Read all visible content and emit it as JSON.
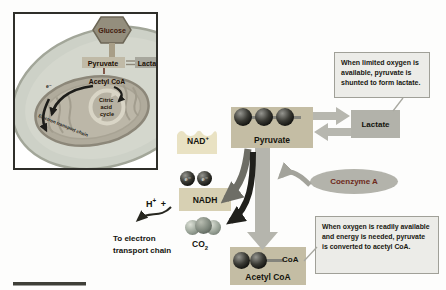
{
  "inset": {
    "glucose": "Glucose",
    "pyruvate": "Pyruvate",
    "lactate": "Lactate",
    "acetyl": "Acetyl CoA",
    "citric": [
      "Citric",
      "acid",
      "cycle"
    ],
    "electron": "e⁻",
    "etc": "Electron transport chain"
  },
  "main": {
    "pyruvate": "Pyruvate",
    "lactate": "Lactate",
    "nad": {
      "base": "NAD",
      "sup": "+"
    },
    "nadh": "NADH",
    "h": {
      "base": "H",
      "sup": "+",
      "tail": "+"
    },
    "to_etc": [
      "To electron",
      "transport chain"
    ],
    "co2": {
      "base": "CO",
      "sub": "2"
    },
    "one_way": "One way",
    "coenzyme": "Coenzyme A",
    "coa": "CoA",
    "acetyl": "Acetyl CoA",
    "electron": "e⁻"
  },
  "callouts": {
    "lactate": "When limited oxygen is available, pyruvate is shunted to form lactate.",
    "acetyl": "When oxygen is readily available and energy is needed, pyruvate is converted to acetyl CoA."
  },
  "colors": {
    "tan_box": "#c4bda4",
    "nad_cream": "#e9e2c3",
    "nadh_box": "#d7d0b3",
    "gray_box": "#b2b2aa",
    "arrow_gray": "#b5b5ad",
    "dark_arrow": "#20201c",
    "callout_bg": "#ecece8",
    "maroon_text": "#6e2a1c"
  }
}
